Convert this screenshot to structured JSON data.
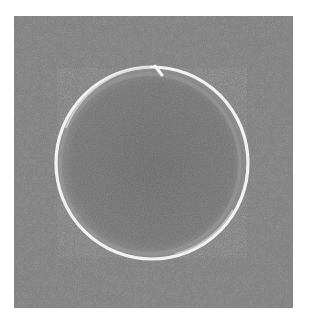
{
  "image": {
    "description": "Petri dish on textured gray surface",
    "subject": "petri-dish",
    "background_color": "#7e7e7e",
    "dish_interior_color": "#6e6e6e",
    "rim_color": "#f2f2f2",
    "frame": {
      "x": 14,
      "y": 16,
      "width": 279,
      "height": 292
    },
    "dish": {
      "cx": 152,
      "cy": 163,
      "r": 96
    }
  }
}
